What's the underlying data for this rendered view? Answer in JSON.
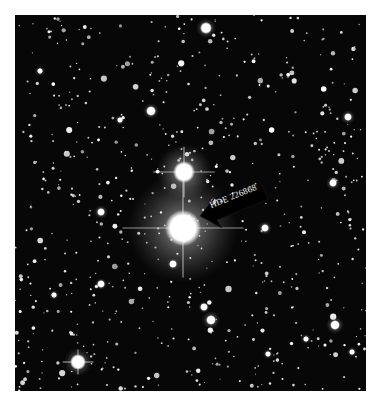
{
  "image": {
    "description": "Black-and-white astronomical photograph of a dense star field with a labeled bright star",
    "frame": {
      "x": 15,
      "y": 15,
      "width": 351,
      "height": 376,
      "background": "#070707",
      "page_background": "#ffffff"
    }
  },
  "annotation": {
    "label": "HDE 226868",
    "arrow_color": "#000000",
    "text_color": "#f2f2f2",
    "target_star": {
      "x": 183,
      "y": 228
    }
  },
  "bright_stars": [
    {
      "x": 183,
      "y": 228,
      "r": 18,
      "glow": 55,
      "spikes": true,
      "name": "HDE 226868"
    },
    {
      "x": 184,
      "y": 172,
      "r": 11,
      "glow": 28,
      "spikes": true
    },
    {
      "x": 78,
      "y": 362,
      "r": 8,
      "glow": 14,
      "spikes": true
    },
    {
      "x": 206,
      "y": 28,
      "r": 6,
      "glow": 10
    },
    {
      "x": 335,
      "y": 325,
      "r": 5,
      "glow": 9
    },
    {
      "x": 151,
      "y": 111,
      "r": 5,
      "glow": 8
    },
    {
      "x": 211,
      "y": 320,
      "r": 5,
      "glow": 9
    },
    {
      "x": 101,
      "y": 212,
      "r": 4,
      "glow": 7
    },
    {
      "x": 333,
      "y": 183,
      "r": 4,
      "glow": 7
    },
    {
      "x": 265,
      "y": 228,
      "r": 4,
      "glow": 7
    },
    {
      "x": 348,
      "y": 117,
      "r": 4,
      "glow": 7
    },
    {
      "x": 101,
      "y": 284,
      "r": 4,
      "glow": 6
    },
    {
      "x": 173,
      "y": 264,
      "r": 4,
      "glow": 6
    },
    {
      "x": 204,
      "y": 307,
      "r": 4,
      "glow": 6
    },
    {
      "x": 120,
      "y": 120,
      "r": 3,
      "glow": 5
    },
    {
      "x": 40,
      "y": 71,
      "r": 3,
      "glow": 5
    },
    {
      "x": 54,
      "y": 295,
      "r": 3,
      "glow": 5
    },
    {
      "x": 306,
      "y": 339,
      "r": 3,
      "glow": 5
    },
    {
      "x": 268,
      "y": 354,
      "r": 3,
      "glow": 5
    },
    {
      "x": 352,
      "y": 352,
      "r": 3,
      "glow": 5
    }
  ]
}
